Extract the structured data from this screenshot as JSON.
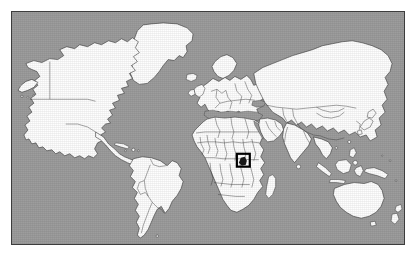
{
  "figure": {
    "kind": "world-locator-map",
    "title": "",
    "caption": "",
    "projection": "equirectangular",
    "frame": {
      "x": 11,
      "y": 11,
      "width": 394,
      "height": 234,
      "border_color": "#3d3d3d"
    },
    "colors": {
      "ocean": "#9d9d9d",
      "land": "#fefefe",
      "coastline": "#2a2a2a",
      "country_border": "#3a3a3a",
      "highlight": "#000000",
      "page_background": "#ffffff"
    }
  },
  "highlight": {
    "label": "",
    "region_name": "African Great Lakes",
    "shape": "rectangle",
    "x": 238,
    "y": 156,
    "width": 14,
    "height": 14,
    "stroke_color": "#000000"
  },
  "landmasses": [
    {
      "name": "north-america"
    },
    {
      "name": "greenland"
    },
    {
      "name": "south-america"
    },
    {
      "name": "europe"
    },
    {
      "name": "africa"
    },
    {
      "name": "asia"
    },
    {
      "name": "australia"
    },
    {
      "name": "new-zealand"
    },
    {
      "name": "madagascar"
    },
    {
      "name": "japan"
    },
    {
      "name": "indonesia"
    },
    {
      "name": "philippines"
    },
    {
      "name": "british-isles"
    },
    {
      "name": "iceland"
    },
    {
      "name": "new-guinea"
    },
    {
      "name": "sri-lanka"
    },
    {
      "name": "cuba"
    }
  ],
  "legend": {
    "visible": false,
    "entries": []
  },
  "axes": {
    "visible": false,
    "graticule": false
  }
}
